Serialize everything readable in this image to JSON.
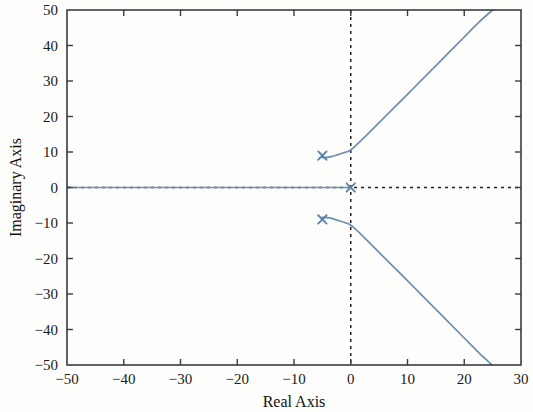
{
  "chart_data": {
    "type": "line",
    "title": "",
    "xlabel": "Real Axis",
    "ylabel": "Imaginary Axis",
    "xlim": [
      -50,
      30
    ],
    "ylim": [
      -50,
      50
    ],
    "xticks": [
      -50,
      -40,
      -30,
      -20,
      -10,
      0,
      10,
      20,
      30
    ],
    "xtick_labels": [
      "−50",
      "−40",
      "−30",
      "−20",
      "−10",
      "0",
      "10",
      "20",
      "30"
    ],
    "yticks": [
      -50,
      -40,
      -30,
      -20,
      -10,
      0,
      10,
      20,
      30,
      40,
      50
    ],
    "ytick_labels": [
      "−50",
      "−40",
      "−30",
      "−20",
      "−10",
      "0",
      "10",
      "20",
      "30",
      "40",
      "50"
    ],
    "grid": false,
    "legend": null,
    "reference_lines": [
      {
        "name": "imaginary-axis-reference",
        "orientation": "vertical",
        "value": 0,
        "style": "dashed",
        "color": "#22222a"
      },
      {
        "name": "real-axis-reference",
        "orientation": "horizontal",
        "value": 0,
        "style": "dashed",
        "color": "#22222a"
      }
    ],
    "markers": [
      {
        "name": "open-loop-pole-upper",
        "symbol": "x",
        "x": -5,
        "y": 9,
        "color": "#5f82a4"
      },
      {
        "name": "open-loop-pole-lower",
        "symbol": "x",
        "x": -5,
        "y": -9,
        "color": "#5f82a4"
      },
      {
        "name": "open-loop-pole-origin",
        "symbol": "x",
        "x": 0,
        "y": 0,
        "color": "#5f82a4"
      }
    ],
    "series": [
      {
        "name": "root-locus-real-axis-branch",
        "color": "#6e8fad",
        "points": [
          [
            -50,
            0
          ],
          [
            -40,
            0
          ],
          [
            -30,
            0
          ],
          [
            -20,
            0
          ],
          [
            -10,
            0
          ],
          [
            -5,
            0
          ],
          [
            -2,
            0
          ],
          [
            0,
            0
          ]
        ]
      },
      {
        "name": "root-locus-upper-branch",
        "color": "#6e8fad",
        "points": [
          [
            -5,
            8.4
          ],
          [
            -4.2,
            8.5
          ],
          [
            -3.4,
            8.7
          ],
          [
            -2.6,
            9.1
          ],
          [
            -1.8,
            9.5
          ],
          [
            -1.0,
            9.9
          ],
          [
            -0.3,
            10.3
          ],
          [
            0.6,
            11.4
          ],
          [
            1.8,
            13.2
          ],
          [
            3.2,
            15.4
          ],
          [
            5.0,
            18.3
          ],
          [
            7.2,
            21.8
          ],
          [
            9.6,
            25.6
          ],
          [
            12.2,
            29.8
          ],
          [
            14.8,
            34.0
          ],
          [
            17.4,
            38.2
          ],
          [
            20.0,
            42.4
          ],
          [
            22.6,
            46.6
          ],
          [
            25.0,
            50.0
          ]
        ]
      },
      {
        "name": "root-locus-lower-branch",
        "color": "#6e8fad",
        "points": [
          [
            -5,
            -8.4
          ],
          [
            -4.2,
            -8.5
          ],
          [
            -3.4,
            -8.7
          ],
          [
            -2.6,
            -9.1
          ],
          [
            -1.8,
            -9.5
          ],
          [
            -1.0,
            -9.9
          ],
          [
            -0.3,
            -10.3
          ],
          [
            0.6,
            -11.4
          ],
          [
            1.8,
            -13.2
          ],
          [
            3.2,
            -15.4
          ],
          [
            5.0,
            -18.3
          ],
          [
            7.2,
            -21.8
          ],
          [
            9.6,
            -25.6
          ],
          [
            12.2,
            -29.8
          ],
          [
            14.8,
            -34.0
          ],
          [
            17.4,
            -38.2
          ],
          [
            20.0,
            -42.4
          ],
          [
            22.6,
            -46.6
          ],
          [
            24.9,
            -50.0
          ]
        ]
      }
    ]
  }
}
